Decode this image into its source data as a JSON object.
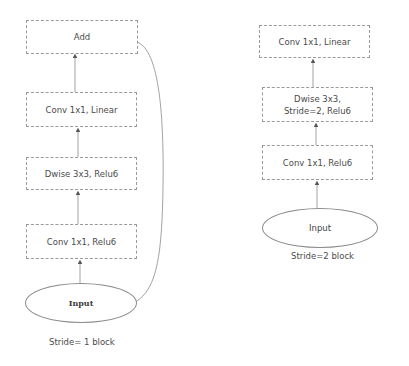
{
  "diagrams": [
    {
      "id": "stride1",
      "caption": "Stride= 1 block",
      "nodes": [
        {
          "label": "Add"
        },
        {
          "label": "Conv 1x1, Linear"
        },
        {
          "label": "Dwise 3x3, Relu6"
        },
        {
          "label": "Conv 1x1, Relu6"
        }
      ],
      "input": {
        "label": "Input"
      },
      "has_skip_connection": true
    },
    {
      "id": "stride2",
      "caption": "Stride=2 block",
      "nodes": [
        {
          "label": "Conv 1x1, Linear"
        },
        {
          "label": "Dwise 3x3, Stride=2, Relu6"
        },
        {
          "label": "Conv 1x1, Relu6"
        }
      ],
      "input": {
        "label": "Input"
      },
      "has_skip_connection": false
    }
  ],
  "colors": {
    "background": "#ffffff",
    "box_border": "#9a9a9a",
    "line": "#8a8a8a",
    "arrowhead": "#555555",
    "text": "#4a4a4a"
  }
}
